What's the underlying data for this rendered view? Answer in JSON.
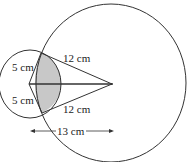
{
  "diagram": {
    "type": "two intersecting circles geometry figure",
    "labels": {
      "radius_large_top": "12 cm",
      "radius_large_bottom": "12 cm",
      "radius_small_top": "5 cm",
      "radius_small_bottom": "5 cm",
      "center_distance": "13 cm"
    },
    "colors": {
      "stroke": "#333333",
      "shaded_region": "#c8c8c8",
      "background": "#ffffff"
    }
  }
}
